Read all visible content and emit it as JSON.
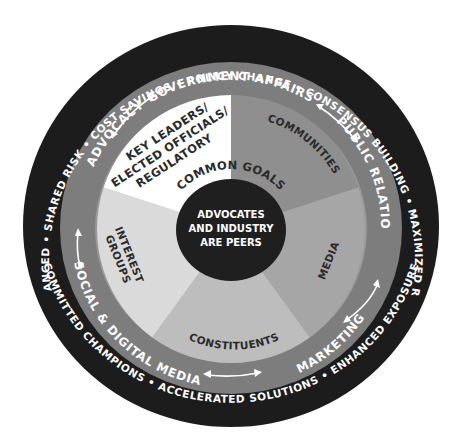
{
  "diagram": {
    "outer_ring": {
      "color": "#1c1c1c",
      "text": "COST SAVINGS • POLICY CHANGE • CONSENSUS BUILDING • MAXIMIZED RESOURCES",
      "bottom_text": "COMMITTED CHAMPIONS • ACCELERATED SOLUTIONS • ENHANCED EXPOSURE",
      "left_text": "GOALS ADVANCED • SHARED RISK •",
      "items": [
        "GOALS ADVANCED",
        "SHARED RISK",
        "COST SAVINGS",
        "POLICY CHANGE",
        "CONSENSUS BUILDING",
        "MAXIMIZED RESOURCES",
        "ENHANCED EXPOSURE",
        "ACCELERATED SOLUTIONS",
        "COMMITTED CHAMPIONS"
      ]
    },
    "middle_ring": {
      "color": "#7d7d7d",
      "items": {
        "government_affairs": "GOVERNMENT AFFAIRS",
        "public_relations": "PUBLIC RELATIONS",
        "marketing": "MARKETING",
        "social_digital_media": "SOCIAL & DIGITAL MEDIA",
        "advocacy": "ADVOCACY"
      }
    },
    "wedges": {
      "communities": {
        "label": "COMMUNITIES",
        "color": "#8f8f8f"
      },
      "media": {
        "label": "MEDIA",
        "color": "#a6a6a6"
      },
      "constituents": {
        "label": "CONSTITUENTS",
        "color": "#bdbdbd"
      },
      "interest_groups": {
        "label_1": "INTEREST",
        "label_2": "GROUPS",
        "color": "#dadada"
      },
      "key_leaders": {
        "label_1": "KEY LEADERS/",
        "label_2": "ELECTED OFFICIALS/",
        "label_3": "REGULATORY",
        "color": "#ffffff"
      }
    },
    "common_goals": "COMMON GOALS",
    "core": {
      "color": "#1f1f1f",
      "line_1": "ADVOCATES",
      "line_2": "AND INDUSTRY",
      "line_3": "ARE PEERS"
    }
  }
}
